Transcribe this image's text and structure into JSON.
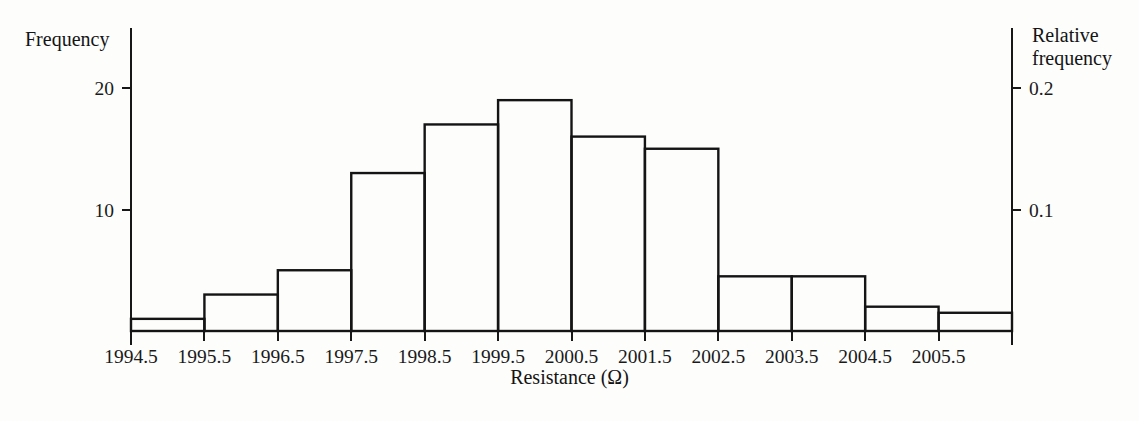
{
  "chart_data": {
    "type": "bar",
    "title": "",
    "subtitle": "",
    "xlabel": "Resistance (Ω)",
    "ylabel": "Frequency",
    "y2label": "Relative frequency",
    "categories": [
      "1994.5-1995.5",
      "1995.5-1996.5",
      "1996.5-1997.5",
      "1997.5-1998.5",
      "1998.5-1999.5",
      "1999.5-2000.5",
      "2000.5-2001.5",
      "2001.5-2002.5",
      "2002.5-2003.5",
      "2003.5-2004.5",
      "2004.5-2005.5",
      "2005.5-2006.5"
    ],
    "bin_edges": [
      1994.5,
      1995.5,
      1996.5,
      1997.5,
      1998.5,
      1999.5,
      2000.5,
      2001.5,
      2002.5,
      2003.5,
      2004.5,
      2005.5,
      2006.5
    ],
    "values": [
      1,
      3,
      5,
      13,
      17,
      19,
      16,
      15,
      4.5,
      4.5,
      2,
      1.5
    ],
    "relative_values": [
      0.01,
      0.03,
      0.05,
      0.13,
      0.17,
      0.19,
      0.16,
      0.15,
      0.045,
      0.045,
      0.02,
      0.015
    ],
    "xtick_labels": [
      "1994.5",
      "1995.5",
      "1996.5",
      "1997.5",
      "1998.5",
      "1999.5",
      "2000.5",
      "2001.5",
      "2002.5",
      "2003.5",
      "2004.5",
      "2005.5"
    ],
    "ytick_labels": [
      "20",
      "10"
    ],
    "ytick_values": [
      20,
      10
    ],
    "y2tick_labels": [
      "0.2",
      "0.1"
    ],
    "y2tick_values": [
      0.2,
      0.1
    ],
    "ylim": [
      0,
      23
    ],
    "y2lim": [
      0,
      0.23
    ],
    "grid": false,
    "legend": "none",
    "bar_fill": "#ffffff",
    "bar_stroke": "#141414",
    "axis_color": "#171717",
    "background": "#fdfdfc"
  },
  "labels": {
    "frequency": "Frequency",
    "relative_frequency_line1": "Relative",
    "relative_frequency_line2": "frequency",
    "xaxis_title": "Resistance (Ω)"
  }
}
